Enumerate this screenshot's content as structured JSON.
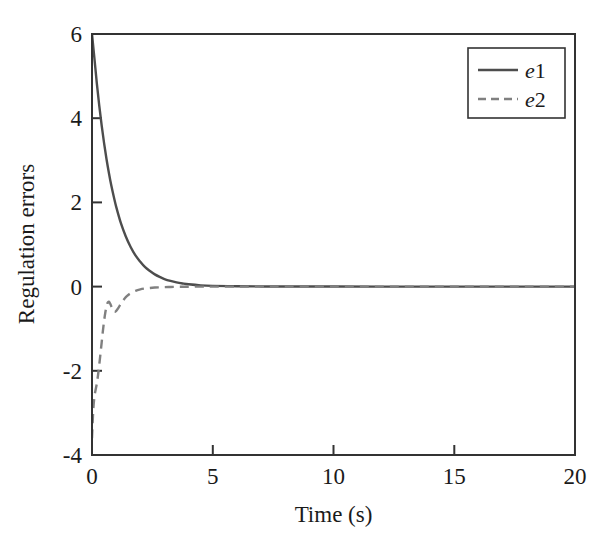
{
  "chart_data": {
    "type": "line",
    "title": "",
    "xlabel": "Time (s)",
    "ylabel": "Regulation errors",
    "xlim": [
      0,
      20
    ],
    "ylim": [
      -4,
      6
    ],
    "xticks": [
      0,
      5,
      10,
      15,
      20
    ],
    "yticks": [
      -4,
      -2,
      0,
      2,
      4,
      6
    ],
    "xticklabels": [
      "0",
      "5",
      "10",
      "15",
      "20"
    ],
    "yticklabels": [
      "-4",
      "-2",
      "0",
      "2",
      "4",
      "6"
    ],
    "grid": false,
    "legend_position": "upper right",
    "box": true,
    "series": [
      {
        "name": "e1",
        "style": "solid",
        "color": "#4d4d4d",
        "width": 2.4,
        "x": [
          0,
          0.1,
          0.2,
          0.3,
          0.4,
          0.5,
          0.6,
          0.7,
          0.8,
          0.9,
          1.0,
          1.2,
          1.4,
          1.6,
          1.8,
          2.0,
          2.2,
          2.4,
          2.6,
          2.8,
          3.0,
          3.25,
          3.5,
          3.75,
          4.0,
          4.5,
          5.0,
          6.0,
          7.0,
          8.0,
          10.0,
          12.0,
          14.0,
          16.0,
          18.0,
          20.0
        ],
        "y": [
          6.0,
          5.42,
          4.83,
          4.3,
          3.83,
          3.41,
          3.03,
          2.7,
          2.4,
          2.14,
          1.9,
          1.5,
          1.19,
          0.94,
          0.74,
          0.59,
          0.46,
          0.37,
          0.29,
          0.23,
          0.18,
          0.135,
          0.1,
          0.075,
          0.055,
          0.03,
          0.018,
          0.008,
          0.004,
          0.002,
          0.001,
          0.0005,
          0.0003,
          0.0002,
          0.0001,
          0.0
        ]
      },
      {
        "name": "e2",
        "style": "dashed",
        "color": "#808080",
        "width": 2.4,
        "x": [
          0,
          0.05,
          0.1,
          0.15,
          0.2,
          0.25,
          0.3,
          0.35,
          0.4,
          0.45,
          0.5,
          0.55,
          0.6,
          0.65,
          0.7,
          0.75,
          0.8,
          0.85,
          0.9,
          0.95,
          1.0,
          1.1,
          1.2,
          1.3,
          1.4,
          1.5,
          1.6,
          1.8,
          2.0,
          2.2,
          2.4,
          2.6,
          2.8,
          3.0,
          3.25,
          3.5,
          3.75,
          4.0,
          4.5,
          5.0,
          6.0,
          7.0,
          8.0,
          10.0,
          12.0,
          14.0,
          16.0,
          18.0,
          20.0
        ],
        "y": [
          -3.6,
          -2.95,
          -2.62,
          -2.45,
          -2.3,
          -2.1,
          -1.86,
          -1.6,
          -1.33,
          -1.06,
          -0.82,
          -0.62,
          -0.47,
          -0.38,
          -0.36,
          -0.4,
          -0.47,
          -0.54,
          -0.59,
          -0.6,
          -0.58,
          -0.5,
          -0.4,
          -0.32,
          -0.25,
          -0.2,
          -0.16,
          -0.1,
          -0.065,
          -0.045,
          -0.032,
          -0.023,
          -0.017,
          -0.012,
          -0.008,
          -0.005,
          -0.0035,
          -0.0025,
          -0.0012,
          -0.0006,
          -0.0002,
          -0.0001,
          0.0,
          0.0,
          0.0,
          0.0,
          0.0,
          0.0,
          0.0
        ]
      }
    ],
    "legend": [
      {
        "label_prefix": "e",
        "label_suffix": "1",
        "style": "solid",
        "color": "#4d4d4d"
      },
      {
        "label_prefix": "e",
        "label_suffix": "2",
        "style": "dashed",
        "color": "#808080"
      }
    ],
    "colors": {
      "axis": "#333333",
      "background": "#ffffff",
      "e1": "#4d4d4d",
      "e2": "#808080",
      "text": "#1a1a1a"
    }
  },
  "geometry": {
    "left": 92,
    "right": 575,
    "top": 34,
    "bottom": 455,
    "legend_box": {
      "x": 468,
      "y": 48,
      "w": 97,
      "h": 70
    }
  }
}
